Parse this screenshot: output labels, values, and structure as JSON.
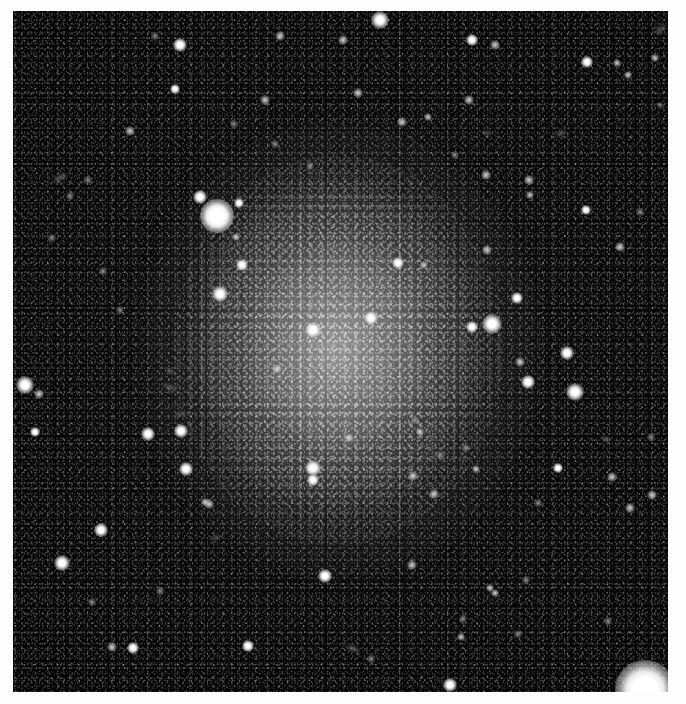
{
  "page": {
    "background_color": "#fdfdfd",
    "width": 686,
    "height": 704
  },
  "plate": {
    "name": "astronomical-plate",
    "description": "Grayscale telescope image of a dwarf irregular galaxy resolved into individual stars",
    "frame": {
      "left": 13,
      "top": 11,
      "width": 655,
      "height": 681
    },
    "sky_color": "#050505",
    "star_color": "#ffffff",
    "galaxy_haze_color": "#bdbdbd"
  },
  "galaxy": {
    "name": "resolved-dwarf-galaxy",
    "halos": [
      {
        "cx": 340,
        "cy": 350,
        "rx": 200,
        "ry": 230,
        "layer": "outer"
      },
      {
        "cx": 335,
        "cy": 345,
        "rx": 140,
        "ry": 165,
        "layer": "mid"
      },
      {
        "cx": 338,
        "cy": 348,
        "rx": 86,
        "ry": 104,
        "layer": "core"
      }
    ],
    "speckle": {
      "cx": 338,
      "cy": 350,
      "rx": 165,
      "ry": 195
    }
  },
  "stars": [
    {
      "x": 217,
      "y": 216,
      "r": 17,
      "class": "brightest"
    },
    {
      "x": 645,
      "y": 690,
      "r": 30,
      "class": "brightest"
    },
    {
      "x": 200,
      "y": 197,
      "r": 7,
      "class": ""
    },
    {
      "x": 239,
      "y": 203,
      "r": 5,
      "class": ""
    },
    {
      "x": 236,
      "y": 237,
      "r": 4,
      "class": "faint"
    },
    {
      "x": 220,
      "y": 294,
      "r": 8,
      "class": ""
    },
    {
      "x": 242,
      "y": 265,
      "r": 6,
      "class": ""
    },
    {
      "x": 313,
      "y": 330,
      "r": 8,
      "class": ""
    },
    {
      "x": 371,
      "y": 318,
      "r": 7,
      "class": ""
    },
    {
      "x": 313,
      "y": 468,
      "r": 8,
      "class": ""
    },
    {
      "x": 313,
      "y": 480,
      "r": 6,
      "class": ""
    },
    {
      "x": 492,
      "y": 324,
      "r": 10,
      "class": ""
    },
    {
      "x": 472,
      "y": 327,
      "r": 6,
      "class": ""
    },
    {
      "x": 517,
      "y": 298,
      "r": 6,
      "class": ""
    },
    {
      "x": 567,
      "y": 353,
      "r": 7,
      "class": ""
    },
    {
      "x": 520,
      "y": 362,
      "r": 5,
      "class": "faint"
    },
    {
      "x": 575,
      "y": 392,
      "r": 9,
      "class": ""
    },
    {
      "x": 528,
      "y": 382,
      "r": 7,
      "class": ""
    },
    {
      "x": 25,
      "y": 385,
      "r": 9,
      "class": ""
    },
    {
      "x": 39,
      "y": 394,
      "r": 5,
      "class": "faint"
    },
    {
      "x": 35,
      "y": 432,
      "r": 5,
      "class": ""
    },
    {
      "x": 101,
      "y": 530,
      "r": 7,
      "class": ""
    },
    {
      "x": 62,
      "y": 563,
      "r": 8,
      "class": ""
    },
    {
      "x": 148,
      "y": 434,
      "r": 7,
      "class": ""
    },
    {
      "x": 181,
      "y": 431,
      "r": 7,
      "class": ""
    },
    {
      "x": 186,
      "y": 469,
      "r": 7,
      "class": ""
    },
    {
      "x": 209,
      "y": 504,
      "r": 5,
      "class": "faint"
    },
    {
      "x": 205,
      "y": 502,
      "r": 4,
      "class": "faint"
    },
    {
      "x": 325,
      "y": 576,
      "r": 7,
      "class": ""
    },
    {
      "x": 248,
      "y": 646,
      "r": 6,
      "class": ""
    },
    {
      "x": 112,
      "y": 647,
      "r": 5,
      "class": "faint"
    },
    {
      "x": 133,
      "y": 648,
      "r": 6,
      "class": ""
    },
    {
      "x": 450,
      "y": 685,
      "r": 7,
      "class": ""
    },
    {
      "x": 380,
      "y": 20,
      "r": 9,
      "class": ""
    },
    {
      "x": 180,
      "y": 45,
      "r": 7,
      "class": ""
    },
    {
      "x": 280,
      "y": 36,
      "r": 5,
      "class": "faint"
    },
    {
      "x": 472,
      "y": 40,
      "r": 6,
      "class": ""
    },
    {
      "x": 495,
      "y": 45,
      "r": 5,
      "class": "faint"
    },
    {
      "x": 175,
      "y": 89,
      "r": 5,
      "class": ""
    },
    {
      "x": 265,
      "y": 100,
      "r": 5,
      "class": "faint"
    },
    {
      "x": 343,
      "y": 40,
      "r": 5,
      "class": "faint"
    },
    {
      "x": 587,
      "y": 62,
      "r": 6,
      "class": ""
    },
    {
      "x": 655,
      "y": 58,
      "r": 4,
      "class": "faint"
    },
    {
      "x": 130,
      "y": 131,
      "r": 5,
      "class": "faint"
    },
    {
      "x": 358,
      "y": 93,
      "r": 5,
      "class": "faint"
    },
    {
      "x": 402,
      "y": 122,
      "r": 5,
      "class": "faint"
    },
    {
      "x": 428,
      "y": 117,
      "r": 4,
      "class": "faint"
    },
    {
      "x": 617,
      "y": 63,
      "r": 4,
      "class": "faint"
    },
    {
      "x": 628,
      "y": 75,
      "r": 4,
      "class": "faint"
    },
    {
      "x": 486,
      "y": 175,
      "r": 5,
      "class": "faint"
    },
    {
      "x": 530,
      "y": 195,
      "r": 4,
      "class": "faint"
    },
    {
      "x": 529,
      "y": 180,
      "r": 5,
      "class": "faint"
    },
    {
      "x": 586,
      "y": 210,
      "r": 5,
      "class": ""
    },
    {
      "x": 660,
      "y": 105,
      "r": 3,
      "class": "dim"
    },
    {
      "x": 469,
      "y": 100,
      "r": 5,
      "class": "faint"
    },
    {
      "x": 487,
      "y": 250,
      "r": 5,
      "class": "faint"
    },
    {
      "x": 640,
      "y": 212,
      "r": 4,
      "class": "dim"
    },
    {
      "x": 620,
      "y": 247,
      "r": 5,
      "class": "faint"
    },
    {
      "x": 455,
      "y": 155,
      "r": 4,
      "class": "dim"
    },
    {
      "x": 398,
      "y": 263,
      "r": 6,
      "class": ""
    },
    {
      "x": 424,
      "y": 265,
      "r": 4,
      "class": "faint"
    },
    {
      "x": 277,
      "y": 369,
      "r": 5,
      "class": "faint"
    },
    {
      "x": 349,
      "y": 438,
      "r": 5,
      "class": "faint"
    },
    {
      "x": 420,
      "y": 432,
      "r": 4,
      "class": "faint"
    },
    {
      "x": 466,
      "y": 448,
      "r": 4,
      "class": "dim"
    },
    {
      "x": 434,
      "y": 494,
      "r": 5,
      "class": "faint"
    },
    {
      "x": 558,
      "y": 468,
      "r": 5,
      "class": ""
    },
    {
      "x": 612,
      "y": 477,
      "r": 5,
      "class": "faint"
    },
    {
      "x": 630,
      "y": 508,
      "r": 5,
      "class": "faint"
    },
    {
      "x": 652,
      "y": 495,
      "r": 5,
      "class": "faint"
    },
    {
      "x": 413,
      "y": 476,
      "r": 5,
      "class": "faint"
    },
    {
      "x": 476,
      "y": 469,
      "r": 4,
      "class": "faint"
    },
    {
      "x": 538,
      "y": 503,
      "r": 4,
      "class": "dim"
    },
    {
      "x": 412,
      "y": 565,
      "r": 5,
      "class": "faint"
    },
    {
      "x": 526,
      "y": 580,
      "r": 4,
      "class": "dim"
    },
    {
      "x": 490,
      "y": 588,
      "r": 4,
      "class": "faint"
    },
    {
      "x": 495,
      "y": 593,
      "r": 4,
      "class": "faint"
    },
    {
      "x": 461,
      "y": 637,
      "r": 4,
      "class": "faint"
    },
    {
      "x": 463,
      "y": 619,
      "r": 4,
      "class": "dim"
    },
    {
      "x": 518,
      "y": 634,
      "r": 4,
      "class": "dim"
    },
    {
      "x": 440,
      "y": 455,
      "r": 4,
      "class": "dim"
    },
    {
      "x": 651,
      "y": 437,
      "r": 4,
      "class": "dim"
    },
    {
      "x": 608,
      "y": 621,
      "r": 4,
      "class": "dim"
    },
    {
      "x": 371,
      "y": 659,
      "r": 4,
      "class": "dim"
    },
    {
      "x": 415,
      "y": 420,
      "r": 4,
      "class": "dim"
    },
    {
      "x": 160,
      "y": 591,
      "r": 4,
      "class": "dim"
    },
    {
      "x": 92,
      "y": 602,
      "r": 4,
      "class": "dim"
    },
    {
      "x": 70,
      "y": 196,
      "r": 4,
      "class": "dim"
    },
    {
      "x": 52,
      "y": 238,
      "r": 4,
      "class": "dim"
    },
    {
      "x": 88,
      "y": 180,
      "r": 4,
      "class": "dim"
    },
    {
      "x": 120,
      "y": 310,
      "r": 4,
      "class": "dim"
    },
    {
      "x": 103,
      "y": 271,
      "r": 4,
      "class": "dim"
    },
    {
      "x": 155,
      "y": 36,
      "r": 4,
      "class": "dim"
    },
    {
      "x": 310,
      "y": 166,
      "r": 4,
      "class": "dim"
    },
    {
      "x": 275,
      "y": 144,
      "r": 4,
      "class": "dim"
    },
    {
      "x": 234,
      "y": 124,
      "r": 4,
      "class": "dim"
    }
  ],
  "smudges": [
    {
      "x": 60,
      "y": 178,
      "w": 18,
      "h": 8,
      "rot": -30
    },
    {
      "x": 170,
      "y": 387,
      "w": 16,
      "h": 7,
      "rot": 20
    },
    {
      "x": 180,
      "y": 414,
      "w": 13,
      "h": 6,
      "rot": -15
    },
    {
      "x": 352,
      "y": 648,
      "w": 15,
      "h": 7,
      "rot": 25
    },
    {
      "x": 170,
      "y": 371,
      "w": 12,
      "h": 6,
      "rot": 40
    },
    {
      "x": 561,
      "y": 133,
      "w": 12,
      "h": 7,
      "rot": -20
    },
    {
      "x": 660,
      "y": 30,
      "w": 14,
      "h": 8,
      "rot": -35
    },
    {
      "x": 606,
      "y": 439,
      "w": 12,
      "h": 6,
      "rot": 15
    },
    {
      "x": 215,
      "y": 538,
      "w": 11,
      "h": 6,
      "rot": -25
    },
    {
      "x": 486,
      "y": 133,
      "w": 11,
      "h": 6,
      "rot": 10
    }
  ]
}
